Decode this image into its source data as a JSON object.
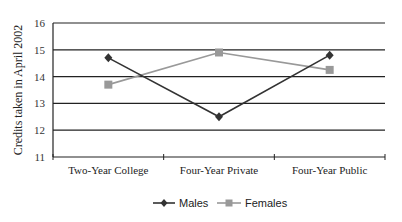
{
  "chart_data": {
    "type": "line",
    "title": "",
    "xlabel": "",
    "ylabel": "Credits taken in April 2002",
    "categories": [
      "Two-Year College",
      "Four-Year Private",
      "Four-Year Public"
    ],
    "series": [
      {
        "name": "Males",
        "values": [
          14.7,
          12.5,
          14.8
        ],
        "color": "#333333",
        "marker": "diamond"
      },
      {
        "name": "Females",
        "values": [
          13.7,
          14.9,
          14.25
        ],
        "color": "#999999",
        "marker": "square"
      }
    ],
    "ylim": [
      11,
      16
    ],
    "yticks": [
      "11",
      "12",
      "13",
      "14",
      "15",
      "16"
    ],
    "grid": true,
    "legend_position": "bottom"
  }
}
